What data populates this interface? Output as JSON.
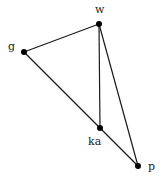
{
  "graph": {
    "nodes": [
      {
        "id": "w",
        "label": "w",
        "x": 99,
        "y": 24,
        "label_x": 98,
        "label_y": 12
      },
      {
        "id": "g",
        "label": "g",
        "x": 24,
        "y": 52,
        "label_x": 11,
        "label_y": 50
      },
      {
        "id": "ka",
        "label": "ka",
        "x": 100,
        "y": 128,
        "label_x": 92,
        "label_y": 144
      },
      {
        "id": "p",
        "label": "p",
        "x": 138,
        "y": 166,
        "label_x": 151,
        "label_y": 170
      }
    ],
    "edges": [
      {
        "from": "w",
        "to": "g"
      },
      {
        "from": "w",
        "to": "ka"
      },
      {
        "from": "w",
        "to": "p"
      },
      {
        "from": "g",
        "to": "ka"
      },
      {
        "from": "ka",
        "to": "p"
      }
    ],
    "colors": {
      "edge": "#1a1a1a",
      "node": "#000000",
      "label": "#222222"
    }
  }
}
